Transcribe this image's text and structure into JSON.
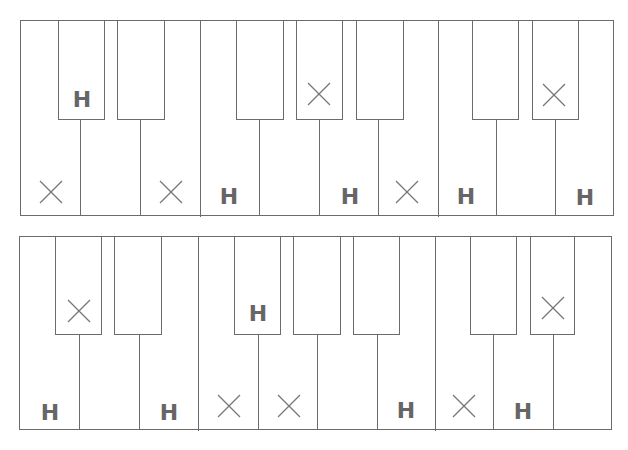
{
  "keyboards": [
    {
      "id": "top",
      "frame": {
        "x": 20,
        "y": 20,
        "w": 594,
        "h": 196
      },
      "white_dividers": [
        80,
        140,
        200,
        259,
        319,
        378,
        438,
        496,
        555
      ],
      "black_keys": [
        [
          58,
          105
        ],
        [
          117,
          165
        ],
        [
          236,
          284
        ],
        [
          296,
          343
        ],
        [
          356,
          404
        ],
        [
          472,
          519
        ],
        [
          532,
          579
        ]
      ],
      "black_bottom": 119,
      "marks": [
        {
          "type": "H",
          "x": 82,
          "y": 100
        },
        {
          "type": "X",
          "x": 51,
          "y": 192
        },
        {
          "type": "X",
          "x": 171,
          "y": 192
        },
        {
          "type": "H",
          "x": 229,
          "y": 197
        },
        {
          "type": "X",
          "x": 319,
          "y": 94
        },
        {
          "type": "H",
          "x": 350,
          "y": 197
        },
        {
          "type": "X",
          "x": 407,
          "y": 192
        },
        {
          "type": "H",
          "x": 466,
          "y": 197
        },
        {
          "type": "X",
          "x": 554,
          "y": 95
        },
        {
          "type": "H",
          "x": 585,
          "y": 198
        }
      ]
    },
    {
      "id": "bottom",
      "frame": {
        "x": 19,
        "y": 236,
        "w": 593,
        "h": 194
      },
      "white_dividers": [
        79,
        139,
        198,
        258,
        317,
        377,
        435,
        493,
        553
      ],
      "black_keys": [
        [
          55,
          102
        ],
        [
          114,
          162
        ],
        [
          234,
          281
        ],
        [
          293,
          341
        ],
        [
          353,
          400
        ],
        [
          470,
          517
        ],
        [
          530,
          575
        ]
      ],
      "black_bottom": 334,
      "marks": [
        {
          "type": "X",
          "x": 79,
          "y": 311
        },
        {
          "type": "H",
          "x": 50,
          "y": 413
        },
        {
          "type": "H",
          "x": 169,
          "y": 413
        },
        {
          "type": "X",
          "x": 229,
          "y": 406
        },
        {
          "type": "H",
          "x": 258,
          "y": 314
        },
        {
          "type": "X",
          "x": 289,
          "y": 406
        },
        {
          "type": "H",
          "x": 406,
          "y": 411
        },
        {
          "type": "X",
          "x": 464,
          "y": 406
        },
        {
          "type": "H",
          "x": 523,
          "y": 412
        },
        {
          "type": "X",
          "x": 553,
          "y": 308
        }
      ]
    }
  ],
  "labels": {
    "h": "H"
  },
  "colors": {
    "line": "#6b6b6b",
    "mark": "#666666"
  }
}
